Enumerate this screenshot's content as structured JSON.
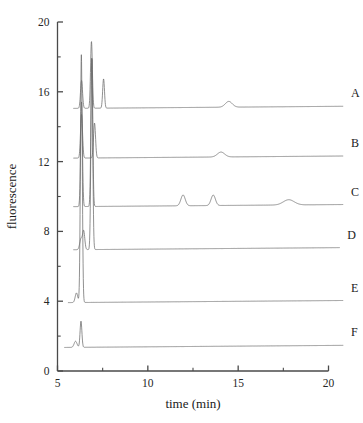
{
  "chart_data": {
    "type": "line",
    "title": "",
    "xlabel": "time (min)",
    "ylabel": "fluorescence",
    "xlim": [
      5,
      20
    ],
    "ylim": [
      0,
      20
    ],
    "xticks": [
      5,
      10,
      15,
      20
    ],
    "xtick_labels": [
      "5",
      "10",
      "15",
      "20"
    ],
    "xminor_ticks": [
      7.5,
      12.5,
      17.5
    ],
    "yticks": [
      0,
      4,
      8,
      12,
      16,
      20
    ],
    "ytick_labels": [
      "0",
      "4",
      "8",
      "12",
      "16",
      "20"
    ],
    "yminor_ticks": [
      2,
      6,
      10,
      14,
      18
    ],
    "grid": false,
    "legend_position": "right-inline",
    "line_color": "#6b6b6b",
    "axis_color": "#4a4a4a",
    "series": [
      {
        "name": "A",
        "label": "A",
        "baseline": 15.05,
        "start_time": 5.9,
        "end_time": 20.8,
        "peaks": [
          {
            "time": 6.33,
            "height": 1.6,
            "width": 0.055
          },
          {
            "time": 6.88,
            "height": 3.83,
            "width": 0.05
          },
          {
            "time": 7.55,
            "height": 1.68,
            "width": 0.05
          },
          {
            "time": 14.48,
            "height": 0.33,
            "width": 0.19
          }
        ]
      },
      {
        "name": "B",
        "label": "B",
        "baseline": 12.2,
        "start_time": 5.9,
        "end_time": 20.8,
        "peaks": [
          {
            "time": 6.33,
            "height": 2.5,
            "width": 0.055
          },
          {
            "time": 7.05,
            "height": 2.0,
            "width": 0.055
          },
          {
            "time": 14.05,
            "height": 0.28,
            "width": 0.2
          }
        ]
      },
      {
        "name": "C",
        "label": "C",
        "baseline": 9.42,
        "start_time": 5.9,
        "end_time": 20.8,
        "peaks": [
          {
            "time": 6.33,
            "height": 6.0,
            "width": 0.05
          },
          {
            "time": 6.9,
            "height": 8.5,
            "width": 0.05
          },
          {
            "time": 11.95,
            "height": 0.62,
            "width": 0.12
          },
          {
            "time": 13.62,
            "height": 0.6,
            "width": 0.12
          },
          {
            "time": 17.8,
            "height": 0.3,
            "width": 0.3
          }
        ]
      },
      {
        "name": "D",
        "label": "D",
        "baseline": 6.95,
        "start_time": 5.9,
        "end_time": 20.6,
        "peaks": [
          {
            "time": 6.3,
            "height": 0.62,
            "width": 0.07
          },
          {
            "time": 6.45,
            "height": 1.05,
            "width": 0.06
          },
          {
            "time": 6.9,
            "height": 11.0,
            "width": 0.05
          }
        ]
      },
      {
        "name": "E",
        "label": "E",
        "baseline": 3.92,
        "start_time": 5.6,
        "end_time": 20.8,
        "peaks": [
          {
            "time": 6.05,
            "height": 0.55,
            "width": 0.07
          },
          {
            "time": 6.32,
            "height": 14.2,
            "width": 0.05
          }
        ]
      },
      {
        "name": "F",
        "label": "F",
        "baseline": 1.35,
        "start_time": 5.4,
        "end_time": 20.8,
        "peaks": [
          {
            "time": 6.0,
            "height": 0.35,
            "width": 0.08
          },
          {
            "time": 6.3,
            "height": 1.5,
            "width": 0.05
          }
        ]
      }
    ]
  }
}
